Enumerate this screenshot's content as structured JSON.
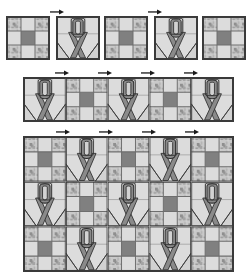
{
  "document": {
    "type": "quilt-pattern-diagram",
    "title": "Ribbon quilt block assembly diagram",
    "background_color": "#ffffff"
  },
  "palette": {
    "outline": "#3a3a3a",
    "seam_line": "#6e6e6e",
    "light_fabric": "#dcdcdc",
    "mottled_fabric": "#b8b8b8",
    "dark_fabric": "#808080",
    "ribbon_fabric": "#8a8a8a",
    "ribbon_outline": "#2e2e2e",
    "arrow_color": "#1a1a1a"
  },
  "block_types": {
    "nine_patch": {
      "name": "nine-patch block",
      "grid": "3x3",
      "cells": [
        "mottled",
        "light",
        "mottled",
        "light",
        "dark",
        "light",
        "mottled",
        "light",
        "mottled"
      ]
    },
    "ribbon": {
      "name": "awareness ribbon block",
      "grid": "3x3",
      "motif": "looped ribbon with crossed tails",
      "corner_triangles": "bottom-left and bottom-right"
    }
  },
  "sections": [
    {
      "id": "row-separate-blocks",
      "name": "individual blocks row",
      "layout": "5 separate blocks with gaps",
      "blocks": [
        "nine_patch",
        "ribbon",
        "nine_patch",
        "ribbon",
        "nine_patch"
      ],
      "arrow_markers_over": [
        1,
        3
      ]
    },
    {
      "id": "row-strip",
      "name": "joined block strip",
      "layout": "5 blocks joined edge to edge",
      "blocks": [
        "ribbon",
        "nine_patch",
        "ribbon",
        "nine_patch",
        "ribbon"
      ],
      "arrow_markers_over": [
        0,
        1,
        2,
        3
      ]
    },
    {
      "id": "quilt-top",
      "name": "assembled quilt top",
      "layout": "5 columns x 3 rows checkerboard",
      "rows": [
        [
          "nine_patch",
          "ribbon",
          "nine_patch",
          "ribbon",
          "nine_patch"
        ],
        [
          "ribbon",
          "nine_patch",
          "ribbon",
          "nine_patch",
          "ribbon"
        ],
        [
          "nine_patch",
          "ribbon",
          "nine_patch",
          "ribbon",
          "nine_patch"
        ]
      ],
      "arrow_markers_over": [
        0,
        1,
        2,
        3
      ]
    }
  ]
}
